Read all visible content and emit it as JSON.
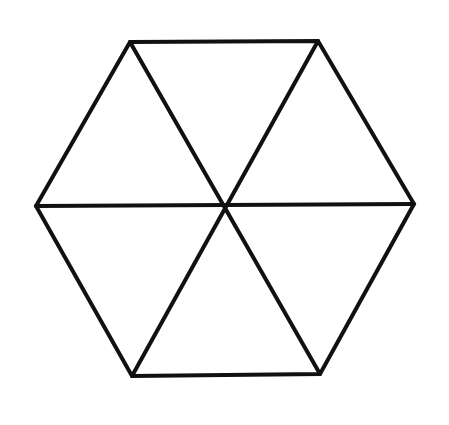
{
  "diagram": {
    "type": "hexagon-subdivided",
    "stroke_color": "#111111",
    "background": "#ffffff",
    "stroke_width": 4,
    "vertices": [
      {
        "name": "top-left",
        "x": 130,
        "y": 42
      },
      {
        "name": "top-right",
        "x": 318,
        "y": 41
      },
      {
        "name": "right",
        "x": 414,
        "y": 204
      },
      {
        "name": "bottom-right",
        "x": 320,
        "y": 374
      },
      {
        "name": "bottom-left",
        "x": 132,
        "y": 376
      },
      {
        "name": "left",
        "x": 36,
        "y": 206
      }
    ],
    "center": {
      "x": 225,
      "y": 205
    },
    "diagonals": [
      [
        "top-left",
        "bottom-right"
      ],
      [
        "top-right",
        "bottom-left"
      ],
      [
        "left",
        "right"
      ]
    ],
    "triangle_count": 6
  }
}
